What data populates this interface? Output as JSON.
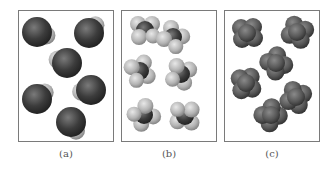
{
  "figure": {
    "panels": [
      {
        "id": "a",
        "label": "(a)",
        "molecule_type": "diatomic-like (large dark atom with small light atom)",
        "molecules": [
          {
            "x": 37,
            "y": 32,
            "angle": 20
          },
          {
            "x": 89,
            "y": 33,
            "angle": -50
          },
          {
            "x": 67,
            "y": 63,
            "angle": 200
          },
          {
            "x": 37,
            "y": 99,
            "angle": -40
          },
          {
            "x": 91,
            "y": 90,
            "angle": 170
          },
          {
            "x": 71,
            "y": 122,
            "angle": 60
          }
        ]
      },
      {
        "id": "b",
        "label": "(b)",
        "molecule_type": "tetrahedral (dark center with four light atoms)",
        "molecules": [
          {
            "x": 145,
            "y": 30
          },
          {
            "x": 173,
            "y": 37
          },
          {
            "x": 140,
            "y": 71
          },
          {
            "x": 181,
            "y": 74
          },
          {
            "x": 144,
            "y": 115
          },
          {
            "x": 185,
            "y": 116
          }
        ]
      },
      {
        "id": "c",
        "label": "(c)",
        "molecule_type": "tetrahedral (uniform dark atoms)",
        "molecules": [
          {
            "x": 247,
            "y": 33
          },
          {
            "x": 297,
            "y": 32
          },
          {
            "x": 276,
            "y": 63
          },
          {
            "x": 246,
            "y": 83
          },
          {
            "x": 296,
            "y": 97
          },
          {
            "x": 271,
            "y": 115
          }
        ]
      }
    ],
    "colors": {
      "border": "#7a7a7a",
      "dark_atom": "#3c3c3c",
      "light_atom": "#bdbdbd",
      "label": "#555555"
    }
  }
}
